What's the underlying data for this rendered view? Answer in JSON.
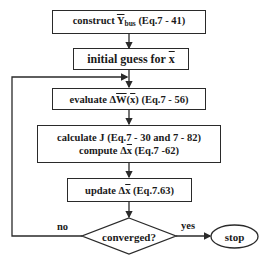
{
  "flowchart": {
    "steps": [
      {
        "id": "construct",
        "prefix": "construct ",
        "symbol": "Y",
        "subscript": "bus",
        "suffix": " (Eq.7 - 41)"
      },
      {
        "id": "initial",
        "prefix": "initial guess for ",
        "symbol": "x",
        "suffix": ""
      },
      {
        "id": "evaluate",
        "prefix": "evaluate Δ",
        "symbol": "W",
        "mid": "(",
        "symbol2": "x",
        "suffix": ") (Eq.7 - 56)"
      },
      {
        "id": "calculate",
        "line1": "calculate J (Eq.7 - 30 and 7 - 82)",
        "line2_prefix": "compute Δ",
        "line2_symbol": "x",
        "line2_suffix": " (Eq.7 -62)"
      },
      {
        "id": "update",
        "prefix": "update Δ",
        "symbol": "x",
        "suffix": " (Eq.7.63)"
      }
    ],
    "decision": {
      "label": "converged?",
      "no_label": "no",
      "yes_label": "yes"
    },
    "terminal": {
      "label": "stop"
    }
  }
}
